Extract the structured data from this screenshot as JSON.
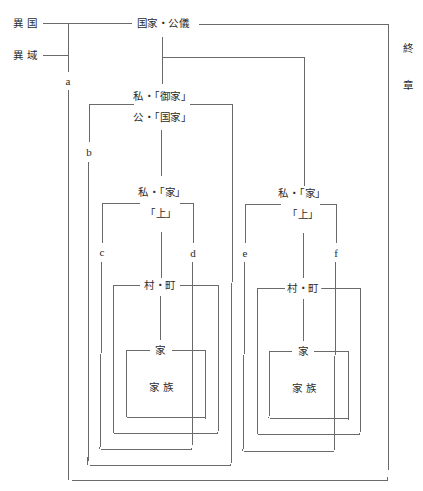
{
  "diagram": {
    "left_labels": {
      "ikoku": "異 国",
      "iiki": "異 域"
    },
    "top_label": "国家・公儀",
    "side_labels": {
      "line1": "終",
      "line2": "章"
    },
    "left_group": {
      "gokenke": "私・「御家」",
      "kokka": "公・「国家」",
      "ie_private": "私・「家」",
      "kami": "「上」",
      "muramachi": "村・町",
      "ie": "家",
      "kazoku": "家 族"
    },
    "right_group": {
      "ie_private": "私・「家」",
      "kami": "「上」",
      "muramachi": "村・町",
      "ie": "家",
      "kazoku": "家 族"
    },
    "boundary_letters": [
      "a",
      "b",
      "c",
      "d",
      "e",
      "f"
    ]
  }
}
